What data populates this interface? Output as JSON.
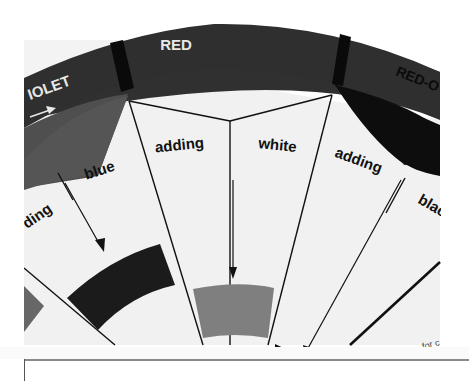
{
  "photo": {
    "subject": "color wheel diagram (cropped)",
    "outer_ring": {
      "segments": [
        {
          "label": "VIOLET",
          "visible_text": "IOLET",
          "arrow": "right-arrow"
        },
        {
          "label": "RED",
          "visible_text": "RED"
        },
        {
          "label": "RED-ORANGE",
          "visible_text": "RED-O"
        }
      ]
    },
    "wedges": [
      {
        "text": "adding",
        "visible_text": "ding"
      },
      {
        "text": "blue"
      },
      {
        "text": "adding"
      },
      {
        "text": "white"
      },
      {
        "text": "adding"
      },
      {
        "text": "black",
        "visible_text": "blac"
      }
    ],
    "footnote": "- for c",
    "colors": {
      "ring_dark": "#2e2e2e",
      "ring_mid": "#4a4a4a",
      "divider": "#0a0a0a",
      "inner_violet": "#555555",
      "inner_redorange": "#0e0e0e",
      "panel_bg": "#f2f2f2",
      "swatch_dark": "#1a1a1a",
      "swatch_gray": "#808080",
      "swatch_left": "#666666"
    }
  }
}
